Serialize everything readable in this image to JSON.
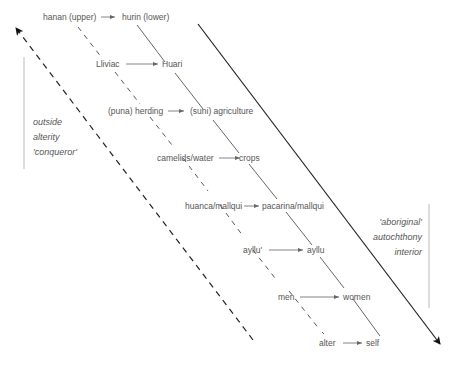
{
  "diagram": {
    "pairs": [
      {
        "left": "hanan (upper)",
        "right": "hurin (lower)"
      },
      {
        "left": "Lliviac",
        "right": "Huari"
      },
      {
        "left": "(puna) herding",
        "right": "(suni) agriculture"
      },
      {
        "left": "camelids/water",
        "right": "crops"
      },
      {
        "left": "huanca/mallqui",
        "right": "pacarina/mallqui"
      },
      {
        "left": "ayllu'",
        "right": "ayllu"
      },
      {
        "left": "men",
        "right": "women"
      },
      {
        "left": "alter",
        "right": "self"
      }
    ],
    "left_side_labels": [
      "outside",
      "alterity",
      "'conqueror'"
    ],
    "right_side_labels": [
      "'aboriginal'",
      "autochthony",
      "interior"
    ],
    "colors": {
      "text": "#555555",
      "line": "#444444",
      "arrow": "#111111",
      "bracket": "#bbbbbb"
    }
  }
}
